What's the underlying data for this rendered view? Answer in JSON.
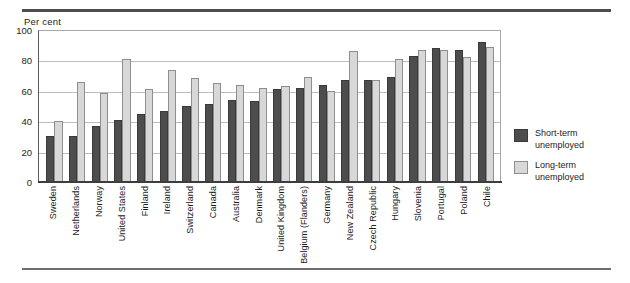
{
  "axis_title": "Per cent",
  "legend": {
    "short": {
      "line1": "Short-term",
      "line2": "unemployed"
    },
    "long": {
      "line1": "Long-term",
      "line2": "unemployed"
    }
  },
  "colors": {
    "short_term": "#4d4d4d",
    "long_term": "#d8d8d8",
    "gridline": "#bdbdbd",
    "axis": "#3d3d3d"
  },
  "yticks": [
    "0",
    "20",
    "40",
    "60",
    "80",
    "100"
  ],
  "chart_data": {
    "type": "bar",
    "title": "",
    "subtitle": "",
    "xlabel": "",
    "ylabel": "Per cent",
    "ylim": [
      0,
      100
    ],
    "grid": true,
    "legend_position": "right",
    "categories": [
      "Sweden",
      "Netherlands",
      "Norway",
      "United States",
      "Finland",
      "Ireland",
      "Switzerland",
      "Canada",
      "Australia",
      "Denmark",
      "United Kingdom",
      "Belgium (Flanders)",
      "Germany",
      "New Zealand",
      "Czech Republic",
      "Hungary",
      "Slovenia",
      "Portugal",
      "Poland",
      "Chile"
    ],
    "series": [
      {
        "name": "Short-term unemployed",
        "color": "#4d4d4d",
        "values": [
          30,
          30.5,
          37,
          41,
          45,
          47,
          50,
          51,
          54,
          53.5,
          61,
          62,
          64,
          67,
          67,
          69,
          83,
          88,
          87,
          92
        ]
      },
      {
        "name": "Long-term unemployed",
        "color": "#d8d8d8",
        "values": [
          40,
          65.5,
          58.5,
          81,
          61.5,
          73.5,
          68.5,
          65,
          63.5,
          62,
          63,
          69,
          60,
          86,
          67,
          81,
          87,
          87,
          82,
          89
        ]
      }
    ]
  }
}
